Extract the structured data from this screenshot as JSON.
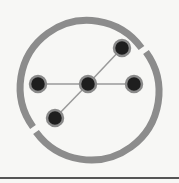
{
  "icon": {
    "name": "network-graph-icon",
    "ring_color": "#8c8c8c",
    "edge_color": "#9a9a9a",
    "node_fill": "#1e1e1e",
    "node_stroke": "#8a8a8a",
    "nodes": [
      {
        "id": "center",
        "x": 88,
        "y": 84
      },
      {
        "id": "left",
        "x": 38,
        "y": 84
      },
      {
        "id": "right",
        "x": 134,
        "y": 84
      },
      {
        "id": "top-right",
        "x": 122,
        "y": 48
      },
      {
        "id": "bottom-left",
        "x": 55,
        "y": 118
      }
    ],
    "edges": [
      [
        "left",
        "center"
      ],
      [
        "center",
        "right"
      ],
      [
        "center",
        "top-right"
      ],
      [
        "center",
        "bottom-left"
      ]
    ]
  }
}
